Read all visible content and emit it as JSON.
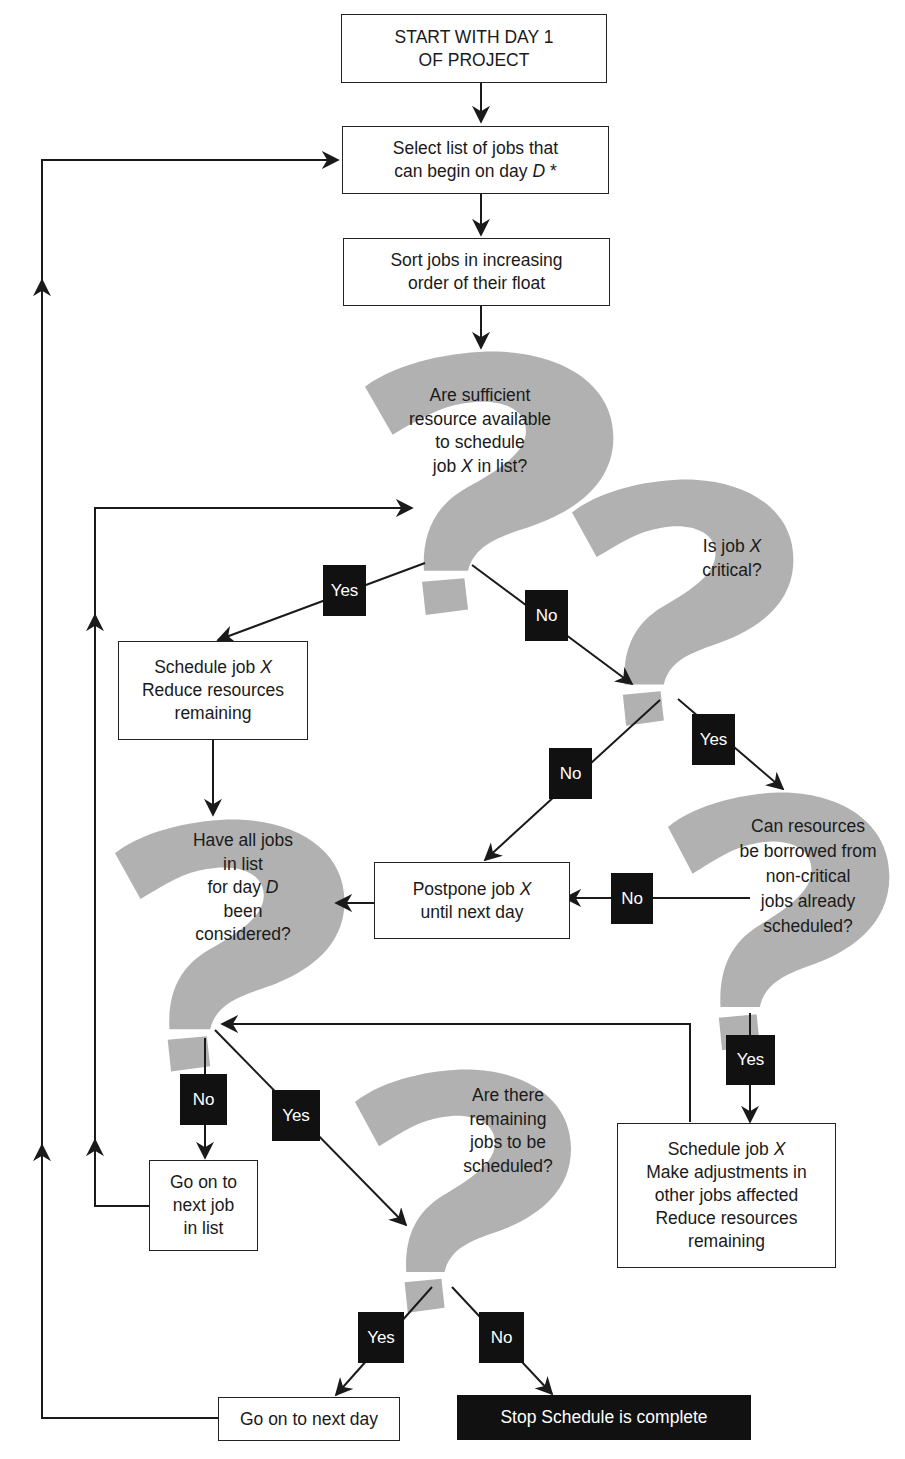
{
  "colors": {
    "question_shape": "#b1b1b1",
    "line": "#1a1a1a",
    "tag_bg": "#111111",
    "tag_text": "#ffffff",
    "box_border": "#222222"
  },
  "nodes": {
    "start": {
      "lines": [
        "START WITH DAY 1",
        "OF PROJECT"
      ]
    },
    "select_jobs": {
      "line1": "Select list of jobs that",
      "line2_pre": "can begin on day ",
      "line2_var": "D",
      "line2_post": " *"
    },
    "sort_jobs": {
      "lines": [
        "Sort jobs in increasing",
        "order of their float"
      ]
    },
    "q_sufficient": {
      "line1": "Are sufficient",
      "line2": "resource available",
      "line3": "to schedule",
      "line4_pre": "job ",
      "line4_var": "X",
      "line4_post": " in list?"
    },
    "q_critical": {
      "line1_pre": "Is job ",
      "line1_var": "X",
      "line2": "critical?"
    },
    "schedule_x": {
      "line1_pre": "Schedule job ",
      "line1_var": "X",
      "line2": "Reduce resources",
      "line3": "remaining"
    },
    "q_all_considered": {
      "line1": "Have all jobs",
      "line2": "in list",
      "line3_pre": "for day ",
      "line3_var": "D",
      "line4": "been",
      "line5": "considered?"
    },
    "postpone": {
      "line1_pre": "Postpone job ",
      "line1_var": "X",
      "line2": "until next day"
    },
    "q_borrow": {
      "lines": [
        "Can resources",
        "be borrowed from",
        "non-critical",
        "jobs already",
        "scheduled?"
      ]
    },
    "next_job": {
      "lines": [
        "Go on to",
        "next job",
        "in list"
      ]
    },
    "q_remaining": {
      "lines": [
        "Are there",
        "remaining",
        "jobs to be",
        "scheduled?"
      ]
    },
    "schedule_adjust": {
      "line1_pre": "Schedule job ",
      "line1_var": "X",
      "line2": "Make adjustments in",
      "line3": "other jobs affected",
      "line4": "Reduce resources",
      "line5": "remaining"
    },
    "next_day": {
      "label": "Go on to next day"
    },
    "stop": {
      "label": "Stop Schedule is complete"
    }
  },
  "tags": {
    "sufficient_yes": "Yes",
    "sufficient_no": "No",
    "critical_yes": "Yes",
    "critical_no": "No",
    "borrow_no": "No",
    "borrow_yes": "Yes",
    "considered_no": "No",
    "considered_yes": "Yes",
    "remaining_yes": "Yes",
    "remaining_no": "No"
  }
}
